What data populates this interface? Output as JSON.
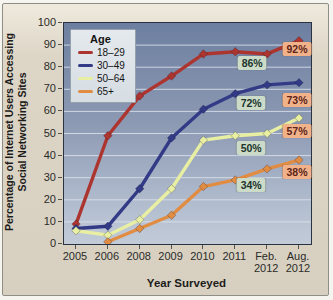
{
  "figure": {
    "y_axis_title_line1": "Percentage of Internet Users Accessing",
    "y_axis_title_line2": "Social Networking Sites",
    "x_axis_title": "Year Surveyed",
    "legend_title": "Age"
  },
  "chart_data": {
    "type": "line",
    "title": "",
    "xlabel": "Year Surveyed",
    "ylabel": "Percentage of Internet Users Accessing Social Networking Sites",
    "ylim": [
      0,
      100
    ],
    "y_ticks": [
      0,
      10,
      20,
      30,
      40,
      50,
      60,
      70,
      80,
      90,
      100
    ],
    "grid": "horizontal",
    "legend_position": "upper-left",
    "legend_title": "Age",
    "categories": [
      "2005",
      "2006",
      "2008",
      "2009",
      "2010",
      "2011",
      "Feb. 2012",
      "Aug. 2012"
    ],
    "x_tick_lines": [
      [
        "2005"
      ],
      [
        "2006"
      ],
      [
        "2008"
      ],
      [
        "2009"
      ],
      [
        "2010"
      ],
      [
        "2011"
      ],
      [
        "Feb.",
        "2012"
      ],
      [
        "Aug.",
        "2012"
      ]
    ],
    "series": [
      {
        "name": "18–29",
        "color": "#ac3530",
        "values": [
          9,
          49,
          67,
          76,
          86,
          87,
          86,
          92
        ]
      },
      {
        "name": "30–49",
        "color": "#333a86",
        "values": [
          7,
          8,
          25,
          48,
          61,
          68,
          72,
          73
        ]
      },
      {
        "name": "50–64",
        "color": "#e8efa2",
        "values": [
          6,
          4,
          11,
          25,
          47,
          49,
          50,
          57
        ]
      },
      {
        "name": "65+",
        "color": "#e18c43",
        "values": [
          null,
          1,
          7,
          13,
          26,
          29,
          34,
          38
        ]
      }
    ],
    "point_labels": [
      {
        "text": "86%",
        "series": "18–29",
        "column": 6,
        "value": 86,
        "style": "green",
        "dx": -14,
        "dy": 10
      },
      {
        "text": "92%",
        "series": "18–29",
        "column": 7,
        "value": 92,
        "style": "salmon",
        "dx": -1,
        "dy": 9
      },
      {
        "text": "72%",
        "series": "30–49",
        "column": 6,
        "value": 72,
        "style": "green",
        "dx": -15,
        "dy": 19
      },
      {
        "text": "73%",
        "series": "30–49",
        "column": 7,
        "value": 73,
        "style": "salmon",
        "dx": -1,
        "dy": 18
      },
      {
        "text": "50%",
        "series": "50–64",
        "column": 6,
        "value": 50,
        "style": "green",
        "dx": -15,
        "dy": 15
      },
      {
        "text": "57%",
        "series": "50–64",
        "column": 7,
        "value": 57,
        "style": "salmon",
        "dx": -1,
        "dy": 14
      },
      {
        "text": "34%",
        "series": "65+",
        "column": 6,
        "value": 34,
        "style": "green",
        "dx": -15,
        "dy": 17
      },
      {
        "text": "38%",
        "series": "65+",
        "column": 7,
        "value": 38,
        "style": "salmon",
        "dx": -1,
        "dy": 13
      }
    ],
    "colors": {
      "plot_bg_top": "#6d7fa0",
      "plot_bg_bottom": "#c2cbd8",
      "gridline": "#dde3ec",
      "card_bg": "#d9d2c3",
      "label_green_bg": "#ccdac8",
      "label_salmon_bg": "#f1b28a"
    }
  }
}
